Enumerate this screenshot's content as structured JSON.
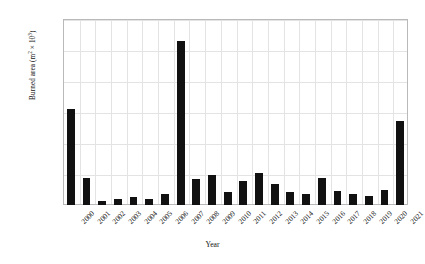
{
  "chart_data": {
    "type": "bar",
    "title": "",
    "xlabel": "Year",
    "ylabel_text": "Burned area (m",
    "ylabel_unit": "2",
    "ylabel_tail": " × 10",
    "ylabel_exp": "3",
    "ylabel": "Burned area (m² × 10³)",
    "categories": [
      "2000",
      "2001",
      "2002",
      "2003",
      "2004",
      "2005",
      "2006",
      "2007",
      "2008",
      "2009",
      "2010",
      "2011",
      "2012",
      "2013",
      "2014",
      "2015",
      "2016",
      "2017",
      "2018",
      "2019",
      "2020",
      "2021"
    ],
    "values": [
      1548000,
      435000,
      65000,
      100000,
      130000,
      105000,
      180000,
      2645000,
      420000,
      480000,
      210000,
      390000,
      520000,
      345000,
      210000,
      175000,
      440000,
      225000,
      180000,
      150000,
      235000,
      1350000
    ],
    "ylim": [
      0,
      3000000
    ],
    "ytick_labels": [
      "0",
      "500.000",
      "1.000.000",
      "1.500.000",
      "2.000.000",
      "2.500.000",
      "3.000.000"
    ],
    "ytick_values": [
      0,
      500000,
      1000000,
      1500000,
      2000000,
      2500000,
      3000000
    ],
    "grid": true,
    "grid_color": "#e3e3e3",
    "bar_color": "#111111",
    "frame_color": "#b9b9b9",
    "legend": null,
    "legend_position": "none"
  }
}
